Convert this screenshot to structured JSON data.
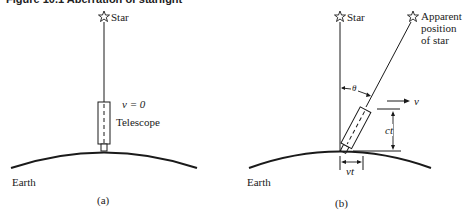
{
  "caption": "Figure 10.1  Aberration of starlight",
  "panel_a": {
    "star_label": "Star",
    "velocity_label": "v = 0",
    "telescope_label": "Telescope",
    "earth_label": "Earth",
    "panel_label": "(a)"
  },
  "panel_b": {
    "star_label": "Star",
    "apparent_label_line1": "Apparent",
    "apparent_label_line2": "position",
    "apparent_label_line3": "of star",
    "angle_label": "θ",
    "velocity_label": "v",
    "vertical_distance_label": "ct",
    "horizontal_distance_label": "vt",
    "earth_label": "Earth",
    "panel_label": "(b)"
  },
  "icons": {
    "star": "☆"
  },
  "colors": {
    "ink": "#1a1a1a",
    "background": "#ffffff"
  }
}
